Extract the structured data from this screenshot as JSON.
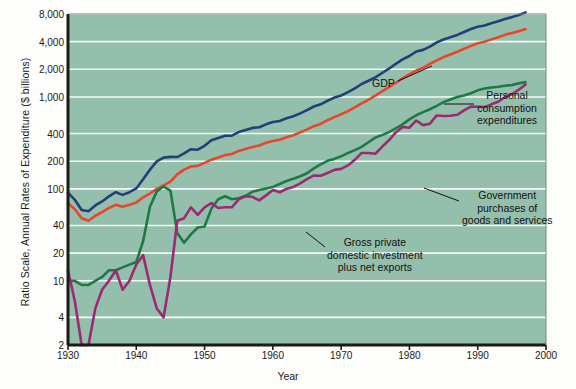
{
  "figure": {
    "background": "#fdfdfb",
    "plot_background": "#93bfac",
    "gridline_color": "#ffffff",
    "axis_color": "#1b1b1b"
  },
  "axes": {
    "y_title": "Ratio Scale, Annual Rates of Expenditure ($ billions)",
    "x_title": "Year",
    "y_ticks": [
      "8,000",
      "4,000",
      "2,000",
      "1,000",
      "400",
      "200",
      "100",
      "40",
      "20",
      "10",
      "4",
      "2"
    ],
    "y_tick_values": [
      8000,
      4000,
      2000,
      1000,
      400,
      200,
      100,
      40,
      20,
      10,
      4,
      2
    ],
    "x_ticks": [
      "1930",
      "1940",
      "1950",
      "1960",
      "1970",
      "1980",
      "1990",
      "2000"
    ],
    "x_tick_values": [
      1930,
      1940,
      1950,
      1960,
      1970,
      1980,
      1990,
      2000
    ]
  },
  "annotations": [
    {
      "name": "gdp",
      "text": "GDP",
      "x": 372,
      "y": 84,
      "align": "left",
      "leader": [
        [
          398,
          81
        ],
        [
          432,
          66
        ]
      ]
    },
    {
      "name": "personal-consumption-expenditures",
      "text": "Personal\nconsumption\nexpenditures",
      "x": 477,
      "y": 96,
      "align": "left",
      "leader": [
        [
          444,
          104
        ],
        [
          474,
          104
        ]
      ]
    },
    {
      "name": "government-purchases",
      "text": "Government\npurchases of\ngoods and services",
      "x": 462,
      "y": 196,
      "align": "left",
      "leader": [
        [
          424,
          188
        ],
        [
          459,
          201
        ]
      ]
    },
    {
      "name": "gross-private-domestic-investment",
      "text": "Gross private\ndomestic investment\nplus net exports",
      "x": 327,
      "y": 243,
      "align": "left",
      "leader": [
        [
          306,
          232
        ],
        [
          325,
          247
        ]
      ]
    }
  ],
  "chart_data": {
    "type": "line",
    "title": "",
    "xlabel": "Year",
    "ylabel": "Ratio Scale, Annual Rates of Expenditure ($ billions)",
    "y_scale": "log",
    "xlim": [
      1930,
      2000
    ],
    "ylim": [
      2,
      8000
    ],
    "grid": true,
    "legend": "annotated-inline",
    "series": [
      {
        "name": "GDP",
        "color": "#243f77",
        "x": [
          1930,
          1931,
          1932,
          1933,
          1934,
          1935,
          1936,
          1937,
          1938,
          1939,
          1940,
          1941,
          1942,
          1943,
          1944,
          1945,
          1946,
          1947,
          1948,
          1949,
          1950,
          1951,
          1952,
          1953,
          1954,
          1955,
          1956,
          1957,
          1958,
          1959,
          1960,
          1961,
          1962,
          1963,
          1964,
          1965,
          1966,
          1967,
          1968,
          1969,
          1970,
          1971,
          1972,
          1973,
          1974,
          1975,
          1976,
          1977,
          1978,
          1979,
          1980,
          1981,
          1982,
          1983,
          1984,
          1985,
          1986,
          1987,
          1988,
          1989,
          1990,
          1991,
          1992,
          1993,
          1994,
          1995,
          1996,
          1997
        ],
        "values": [
          91,
          76,
          59,
          57,
          66,
          73,
          83,
          92,
          86,
          92,
          101,
          127,
          162,
          199,
          219,
          223,
          222,
          244,
          270,
          267,
          294,
          339,
          358,
          379,
          380,
          415,
          438,
          461,
          468,
          504,
          534,
          547,
          586,
          618,
          664,
          720,
          788,
          833,
          910,
          985,
          1039,
          1128,
          1241,
          1385,
          1501,
          1636,
          1824,
          2031,
          2295,
          2566,
          2790,
          3128,
          3255,
          3537,
          3933,
          4220,
          4463,
          4739,
          5104,
          5484,
          5803,
          5996,
          6338,
          6657,
          7072,
          7398,
          7813,
          8318
        ]
      },
      {
        "name": "Personal consumption expenditures",
        "color": "#e8452b",
        "x": [
          1930,
          1931,
          1932,
          1933,
          1934,
          1935,
          1936,
          1937,
          1938,
          1939,
          1940,
          1941,
          1942,
          1943,
          1944,
          1945,
          1946,
          1947,
          1948,
          1949,
          1950,
          1951,
          1952,
          1953,
          1954,
          1955,
          1956,
          1957,
          1958,
          1959,
          1960,
          1961,
          1962,
          1963,
          1964,
          1965,
          1966,
          1967,
          1968,
          1969,
          1970,
          1971,
          1972,
          1973,
          1974,
          1975,
          1976,
          1977,
          1978,
          1979,
          1980,
          1981,
          1982,
          1983,
          1984,
          1985,
          1986,
          1987,
          1988,
          1989,
          1990,
          1991,
          1992,
          1993,
          1994,
          1995,
          1996,
          1997
        ],
        "values": [
          70,
          60,
          48,
          45,
          51,
          56,
          62,
          67,
          64,
          67,
          71,
          81,
          89,
          100,
          109,
          120,
          144,
          162,
          175,
          178,
          192,
          208,
          219,
          233,
          240,
          259,
          271,
          286,
          296,
          318,
          332,
          343,
          364,
          384,
          412,
          444,
          481,
          509,
          559,
          604,
          648,
          702,
          770,
          852,
          933,
          1034,
          1152,
          1278,
          1428,
          1592,
          1757,
          1941,
          2077,
          2290,
          2503,
          2720,
          2899,
          3100,
          3353,
          3598,
          3840,
          3986,
          4235,
          4478,
          4743,
          4976,
          5207,
          5494
        ]
      },
      {
        "name": "Government purchases of goods and services",
        "color": "#1d7a47",
        "x": [
          1930,
          1931,
          1932,
          1933,
          1934,
          1935,
          1936,
          1937,
          1938,
          1939,
          1940,
          1941,
          1942,
          1943,
          1944,
          1945,
          1946,
          1947,
          1948,
          1949,
          1950,
          1951,
          1952,
          1953,
          1954,
          1955,
          1956,
          1957,
          1958,
          1959,
          1960,
          1961,
          1962,
          1963,
          1964,
          1965,
          1966,
          1967,
          1968,
          1969,
          1970,
          1971,
          1972,
          1973,
          1974,
          1975,
          1976,
          1977,
          1978,
          1979,
          1980,
          1981,
          1982,
          1983,
          1984,
          1985,
          1986,
          1987,
          1988,
          1989,
          1990,
          1991,
          1992,
          1993,
          1994,
          1995,
          1996,
          1997
        ],
        "values": [
          10,
          10,
          9,
          9,
          10,
          11,
          13,
          13,
          14,
          15,
          16,
          27,
          64,
          94,
          106,
          96,
          33,
          26,
          32,
          38,
          39,
          61,
          77,
          83,
          77,
          79,
          84,
          93,
          97,
          101,
          105,
          113,
          122,
          129,
          137,
          148,
          167,
          185,
          202,
          212,
          226,
          246,
          264,
          287,
          322,
          361,
          385,
          415,
          456,
          503,
          570,
          632,
          684,
          735,
          800,
          879,
          940,
          999,
          1036,
          1099,
          1181,
          1235,
          1271,
          1291,
          1328,
          1351,
          1406,
          1454
        ]
      },
      {
        "name": "Gross private domestic investment plus net exports",
        "color": "#9c2a72",
        "x": [
          1930,
          1931,
          1932,
          1933,
          1934,
          1935,
          1936,
          1937,
          1938,
          1939,
          1940,
          1941,
          1942,
          1943,
          1944,
          1945,
          1946,
          1947,
          1948,
          1949,
          1950,
          1951,
          1952,
          1953,
          1954,
          1955,
          1956,
          1957,
          1958,
          1959,
          1960,
          1961,
          1962,
          1963,
          1964,
          1965,
          1966,
          1967,
          1968,
          1969,
          1970,
          1971,
          1972,
          1973,
          1974,
          1975,
          1976,
          1977,
          1978,
          1979,
          1980,
          1981,
          1982,
          1983,
          1984,
          1985,
          1986,
          1987,
          1988,
          1989,
          1990,
          1991,
          1992,
          1993,
          1994,
          1995,
          1996,
          1997
        ],
        "values": [
          13,
          6,
          2,
          2,
          5,
          8,
          10,
          13,
          8,
          10,
          15,
          19,
          9,
          5,
          4,
          11,
          45,
          48,
          63,
          52,
          63,
          70,
          62,
          63,
          63,
          77,
          83,
          82,
          75,
          85,
          97,
          92,
          100,
          105,
          115,
          128,
          140,
          139,
          149,
          161,
          165,
          180,
          207,
          246,
          246,
          241,
          287,
          338,
          411,
          471,
          463,
          555,
          494,
          512,
          630,
          621,
          624,
          640,
          715,
          787,
          782,
          775,
          832,
          888,
          1001,
          1071,
          1200,
          1370
        ]
      }
    ]
  }
}
